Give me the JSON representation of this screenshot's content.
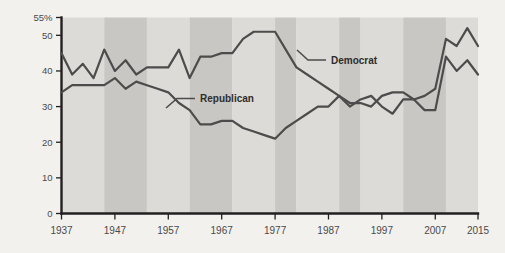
{
  "chart_data": {
    "type": "line",
    "title": "",
    "subtitle": "",
    "xlabel": "",
    "ylabel": "",
    "xlim": [
      1937,
      2015
    ],
    "ylim": [
      0,
      55
    ],
    "grid": false,
    "legend_position": "inline-annotations",
    "y_ticks": [
      {
        "value": 55,
        "label": "55%"
      },
      {
        "value": 50,
        "label": "50"
      },
      {
        "value": 40,
        "label": "40"
      },
      {
        "value": 30,
        "label": "30"
      },
      {
        "value": 20,
        "label": "20"
      },
      {
        "value": 10,
        "label": "10"
      },
      {
        "value": 0,
        "label": "0"
      }
    ],
    "x_ticks": [
      {
        "value": 1937,
        "label": "1937"
      },
      {
        "value": 1947,
        "label": "1947"
      },
      {
        "value": 1957,
        "label": "1957"
      },
      {
        "value": 1967,
        "label": "1967"
      },
      {
        "value": 1977,
        "label": "1977"
      },
      {
        "value": 1987,
        "label": "1987"
      },
      {
        "value": 1997,
        "label": "1997"
      },
      {
        "value": 2007,
        "label": "2007"
      },
      {
        "value": 2015,
        "label": "2015"
      }
    ],
    "bands": [
      {
        "start": 1937,
        "end": 1945,
        "shade": "a"
      },
      {
        "start": 1945,
        "end": 1953,
        "shade": "b"
      },
      {
        "start": 1953,
        "end": 1961,
        "shade": "a"
      },
      {
        "start": 1961,
        "end": 1969,
        "shade": "b"
      },
      {
        "start": 1969,
        "end": 1977,
        "shade": "a"
      },
      {
        "start": 1977,
        "end": 1981,
        "shade": "b"
      },
      {
        "start": 1981,
        "end": 1989,
        "shade": "a"
      },
      {
        "start": 1989,
        "end": 1993,
        "shade": "b"
      },
      {
        "start": 1993,
        "end": 2001,
        "shade": "a"
      },
      {
        "start": 2001,
        "end": 2009,
        "shade": "b"
      },
      {
        "start": 2009,
        "end": 2015,
        "shade": "a"
      }
    ],
    "colors": {
      "background": "#f2f1ee",
      "band_light": "#dcdbd7",
      "band_dark": "#c8c7c3",
      "line": "#4c4c4c",
      "axis": "#231f20",
      "text": "#4a4a4a"
    },
    "series": [
      {
        "name": "Democrat",
        "label": "Democrat",
        "x": [
          1937,
          1939,
          1941,
          1943,
          1945,
          1947,
          1949,
          1951,
          1953,
          1955,
          1957,
          1959,
          1961,
          1963,
          1965,
          1967,
          1969,
          1971,
          1973,
          1975,
          1977,
          1979,
          1981,
          1983,
          1985,
          1987,
          1989,
          1991,
          1993,
          1995,
          1997,
          1999,
          2001,
          2003,
          2005,
          2007,
          2009,
          2011,
          2013,
          2015
        ],
        "values": [
          45,
          39,
          42,
          38,
          46,
          40,
          43,
          39,
          41,
          41,
          41,
          46,
          38,
          44,
          44,
          45,
          45,
          49,
          51,
          51,
          51,
          46,
          41,
          39,
          37,
          35,
          33,
          31,
          31,
          30,
          33,
          34,
          34,
          32,
          33,
          35,
          49,
          47,
          52,
          47
        ]
      },
      {
        "name": "Republican",
        "label": "Republican",
        "x": [
          1937,
          1939,
          1941,
          1943,
          1945,
          1947,
          1949,
          1951,
          1953,
          1955,
          1957,
          1959,
          1961,
          1963,
          1965,
          1967,
          1969,
          1971,
          1973,
          1975,
          1977,
          1979,
          1981,
          1983,
          1985,
          1987,
          1989,
          1991,
          1993,
          1995,
          1997,
          1999,
          2001,
          2003,
          2005,
          2007,
          2009,
          2011,
          2013,
          2015
        ],
        "values": [
          34,
          36,
          36,
          36,
          36,
          38,
          35,
          37,
          36,
          35,
          34,
          31,
          29,
          25,
          25,
          26,
          26,
          24,
          23,
          22,
          21,
          24,
          26,
          28,
          30,
          30,
          33,
          30,
          32,
          33,
          30,
          28,
          32,
          32,
          29,
          29,
          44,
          40,
          43,
          39
        ]
      }
    ],
    "annotations": [
      {
        "text": "Democrat",
        "series": "Democrat"
      },
      {
        "text": "Republican",
        "series": "Republican"
      }
    ]
  }
}
